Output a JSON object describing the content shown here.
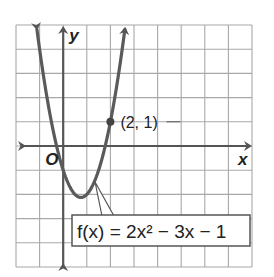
{
  "chart_data": {
    "type": "line",
    "title": "",
    "function": "f(x) = 2x^2 - 3x - 1",
    "function_label": "f(x) = 2x² − 3x − 1",
    "xlabel": "x",
    "ylabel": "y",
    "origin_label": "O",
    "xlim": [
      -2,
      8
    ],
    "ylim": [
      -5,
      5
    ],
    "grid": true,
    "grid_step": 1,
    "coefficients": {
      "a": 2,
      "b": -3,
      "c": -1
    },
    "vertex": [
      0.75,
      -2.125
    ],
    "labeled_points": [
      {
        "x": 2,
        "y": 1,
        "label": "(2, 1)"
      }
    ],
    "series": [
      {
        "name": "f(x) = 2x^2 - 3x - 1",
        "x": [
          -1.14,
          -1,
          -0.5,
          0,
          0.5,
          0.75,
          1,
          1.5,
          2,
          2.5,
          2.64
        ],
        "values": [
          5,
          4,
          1,
          -1,
          -2,
          -2.125,
          -2,
          -1,
          1,
          4,
          5
        ]
      }
    ]
  },
  "labels": {
    "x_axis": "x",
    "y_axis": "y",
    "origin": "O",
    "point": "(2, 1)",
    "function": "f(x) = 2x² − 3x − 1"
  },
  "colors": {
    "grid": "#a8a8a8",
    "axis": "#555555",
    "curve": "#5a5a5a",
    "point": "#444444"
  }
}
